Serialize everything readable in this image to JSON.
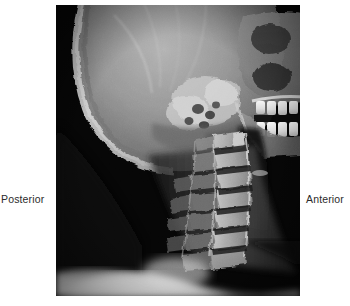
{
  "figure": {
    "modality": "x-ray",
    "view": "lateral",
    "region": "cervical spine and skull",
    "background_color": "#ffffff",
    "film_background_color": "#050505"
  },
  "labels": {
    "posterior": "Posterior",
    "anterior": "Anterior",
    "text_color": "#2b2b2b"
  },
  "image": {
    "frame": {
      "left": 56,
      "top": 5,
      "width": 244,
      "height": 291
    },
    "anatomy": [
      "occipital skull",
      "cranial vault",
      "mastoid air cells",
      "mandible",
      "maxillary teeth",
      "mandibular teeth",
      "cervical vertebrae",
      "soft tissue of neck",
      "shoulder"
    ]
  }
}
